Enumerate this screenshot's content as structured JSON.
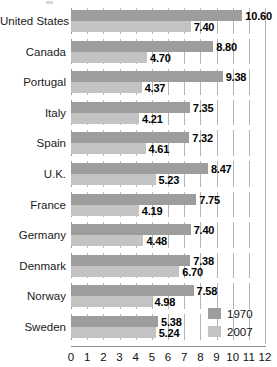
{
  "chart_data": {
    "type": "bar",
    "orientation": "horizontal",
    "title": "",
    "xlabel": "",
    "ylabel": "",
    "xlim": [
      0,
      12
    ],
    "xticks": [
      "0",
      "1",
      "2",
      "3",
      "4",
      "5",
      "6",
      "7",
      "8",
      "9",
      "10",
      "11",
      "12"
    ],
    "grid": true,
    "legend_position": "bottom-right",
    "categories": [
      "United States",
      "Canada",
      "Portugal",
      "Italy",
      "Spain",
      "U.K.",
      "France",
      "Germany",
      "Denmark",
      "Norway",
      "Sweden"
    ],
    "series": [
      {
        "name": "1970",
        "color": "#9d9d9d",
        "values": [
          10.6,
          8.8,
          9.38,
          7.35,
          7.32,
          8.47,
          7.75,
          7.4,
          7.38,
          7.58,
          5.38
        ],
        "labels": [
          "10.60",
          "8.80",
          "9.38",
          "7.35",
          "7.32",
          "8.47",
          "7.75",
          "7.40",
          "7.38",
          "7.58",
          "5.38"
        ]
      },
      {
        "name": "2007",
        "color": "#c3c3c3",
        "values": [
          7.4,
          4.7,
          4.37,
          4.21,
          4.61,
          5.23,
          4.19,
          4.48,
          6.7,
          4.98,
          5.24
        ],
        "labels": [
          "7.40",
          "4.70",
          "4.37",
          "4.21",
          "4.61",
          "5.23",
          "4.19",
          "4.48",
          "6.70",
          "4.98",
          "5.24"
        ]
      }
    ]
  },
  "legend": {
    "items": [
      {
        "label": "1970",
        "color": "#9d9d9d"
      },
      {
        "label": "2007",
        "color": "#c3c3c3"
      }
    ]
  }
}
